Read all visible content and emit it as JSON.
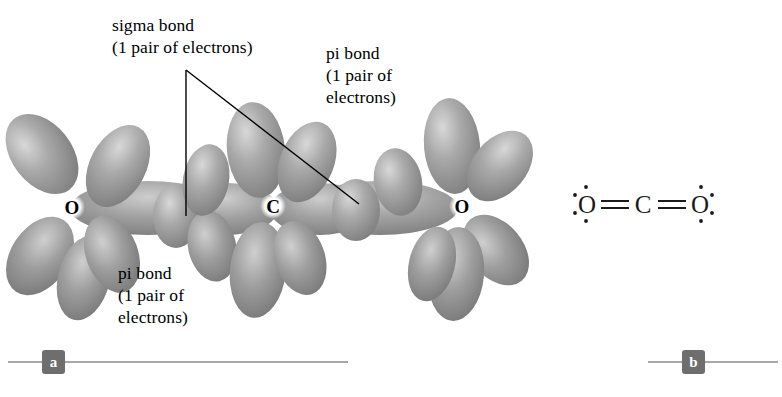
{
  "figure": {
    "background_color": "#ffffff",
    "ink_color": "#000000",
    "orbital_color": "#8f8f8f",
    "rule_color": "#a8a8a8",
    "badge_color": "#6e6e6e"
  },
  "callouts": {
    "sigma_bond": "sigma bond\n(1 pair of electrons)",
    "pi_bond_top": "pi bond\n(1 pair of\nelectrons)",
    "pi_bond_bottom": "pi bond\n(1 pair of\nelectrons)"
  },
  "orbital_diagram": {
    "atoms": [
      {
        "symbol": "O",
        "x": 72,
        "y": 119,
        "role": "left-oxygen"
      },
      {
        "symbol": "C",
        "x": 273,
        "y": 118,
        "role": "central-carbon"
      },
      {
        "symbol": "O",
        "x": 462,
        "y": 118,
        "role": "right-oxygen"
      }
    ],
    "leaders": [
      {
        "name": "sigma-leader",
        "x1": 186,
        "y1": 70,
        "x2": 186,
        "y2": 216
      },
      {
        "name": "pi-leader",
        "x1": 186,
        "y1": 70,
        "x2": 359,
        "y2": 204
      }
    ]
  },
  "lewis_structure": {
    "formula": ":O=C=O:",
    "atoms": [
      "O",
      "C",
      "O"
    ],
    "bonds": [
      "double",
      "double"
    ],
    "bond_glyph": "=",
    "lone_pairs_per_oxygen": 2,
    "dot_glyph": "•"
  },
  "part_labels": {
    "a": "a",
    "b": "b"
  }
}
